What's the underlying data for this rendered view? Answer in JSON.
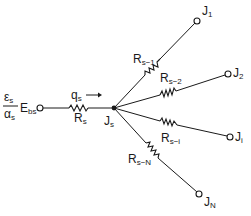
{
  "diagram": {
    "type": "resistor-network",
    "source": {
      "numerator": "ε",
      "numerator_sub": "s",
      "denominator": "α",
      "denominator_sub": "s",
      "potential": "E",
      "potential_sub": "bs"
    },
    "flow": {
      "symbol": "q",
      "sub": "s",
      "arrow": "→"
    },
    "source_resistor": {
      "symbol": "R",
      "sub": "s"
    },
    "junction": {
      "symbol": "J",
      "sub": "s"
    },
    "branches": [
      {
        "resistor": "R",
        "resistor_sub": "s−1",
        "node": "J",
        "node_sub": "1"
      },
      {
        "resistor": "R",
        "resistor_sub": "s−2",
        "node": "J",
        "node_sub": "2"
      },
      {
        "resistor": "R",
        "resistor_sub": "s−i",
        "node": "J",
        "node_sub": "i"
      },
      {
        "resistor": "R",
        "resistor_sub": "s−N",
        "node": "J",
        "node_sub": "N"
      }
    ],
    "colors": {
      "ink": "#1a1a1a",
      "background": "#ffffff"
    }
  }
}
